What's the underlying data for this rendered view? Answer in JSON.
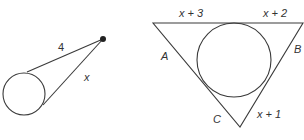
{
  "figure_left": {
    "labels": {
      "tangent_upper": "4",
      "tangent_lower": "x"
    },
    "geometry": {
      "circle": {
        "cx": 24,
        "cy": 94,
        "r": 21
      },
      "external_point": {
        "x": 103,
        "y": 39
      },
      "tangent_point_upper": {
        "x": 27,
        "y": 72
      },
      "tangent_point_lower": {
        "x": 43,
        "y": 105
      }
    }
  },
  "figure_right": {
    "labels": {
      "top_left_segment": "x + 3",
      "top_right_segment": "x + 2",
      "side_left": "A",
      "side_right": "B",
      "side_bottom_left": "C",
      "bottom_right_segment": "x + 1"
    },
    "geometry": {
      "triangle": [
        {
          "x": 153,
          "y": 23
        },
        {
          "x": 303,
          "y": 23
        },
        {
          "x": 240,
          "y": 127
        }
      ],
      "incircle": {
        "cx": 234,
        "cy": 60,
        "r": 37
      }
    }
  },
  "colors": {
    "stroke": "#3a3a3a",
    "text": "#333333",
    "background": "#ffffff"
  }
}
